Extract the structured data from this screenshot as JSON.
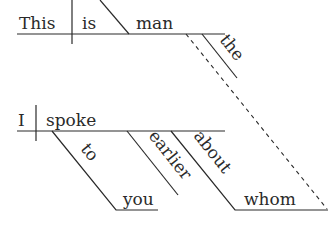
{
  "diagram": {
    "type": "sentence-diagram (Reed-Kellogg)",
    "clause_main": {
      "subject": "This",
      "verb": "is",
      "predicate_nominative": "man",
      "modifiers": [
        "the"
      ]
    },
    "clause_relative": {
      "subject": "I",
      "verb": "spoke",
      "modifiers": {
        "prep1": "to",
        "prep1_object": "you",
        "adverb": "earlier",
        "prep2": "about",
        "prep2_object": "whom"
      }
    },
    "connector": "dashed line linking 'man' to 'whom'"
  }
}
